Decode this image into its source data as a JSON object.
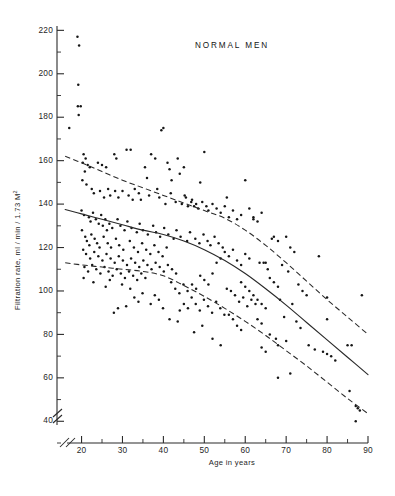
{
  "chart_data": {
    "type": "scatter",
    "title": "NORMAL MEN",
    "xlabel": "Age in years",
    "ylabel": "Filtration rate, ml / min / 1.73 M",
    "ylabel_superscript": "2",
    "xlim": [
      14,
      90
    ],
    "ylim": [
      30,
      222
    ],
    "xticks": [
      20,
      30,
      40,
      50,
      60,
      70,
      80,
      90
    ],
    "xtick_labels": [
      "20",
      "30",
      "40",
      "50",
      "60",
      "70",
      "80",
      "90"
    ],
    "x_minor_step": 5,
    "yticks": [
      40,
      60,
      80,
      100,
      120,
      140,
      160,
      180,
      200,
      220
    ],
    "ytick_labels": [
      "40",
      "60",
      "80",
      "100",
      "120",
      "140",
      "160",
      "180",
      "200",
      "220"
    ],
    "y_minor_step": 10,
    "grid": false,
    "legend": null,
    "axis_break": true,
    "axis_break_note": "double-slash break near origin on both axes",
    "marker_color": "#161616",
    "curve_color": "#2a2a2a",
    "series": [
      {
        "name": "mean regression",
        "style": "solid",
        "x": [
          16,
          20,
          25,
          30,
          35,
          40,
          45,
          50,
          55,
          60,
          65,
          70,
          75,
          80,
          85,
          90
        ],
        "values": [
          137.5,
          135.5,
          133.0,
          130.5,
          128.0,
          126.0,
          123.0,
          119.0,
          114.0,
          108.0,
          101.0,
          93.5,
          85.5,
          77.5,
          69.5,
          61.5
        ]
      },
      {
        "name": "upper limit",
        "style": "dashed",
        "x": [
          16,
          20,
          25,
          30,
          35,
          40,
          45,
          50,
          55,
          60,
          65,
          70,
          75,
          80,
          85,
          90
        ],
        "values": [
          162.0,
          159.0,
          155.0,
          151.0,
          147.5,
          144.0,
          140.5,
          137.0,
          133.5,
          128.0,
          121.0,
          113.0,
          104.5,
          96.0,
          88.0,
          80.0
        ]
      },
      {
        "name": "lower limit",
        "style": "dashed",
        "x": [
          16,
          20,
          25,
          30,
          35,
          40,
          45,
          50,
          55,
          60,
          65,
          70,
          75,
          80,
          85,
          90
        ],
        "values": [
          113.0,
          112.0,
          111.0,
          110.0,
          109.0,
          107.0,
          102.5,
          97.5,
          92.0,
          86.0,
          79.5,
          72.5,
          65.5,
          58.0,
          50.5,
          43.5
        ]
      }
    ],
    "points": [
      [
        19,
        217
      ],
      [
        19.4,
        213
      ],
      [
        19.2,
        195
      ],
      [
        19.1,
        185
      ],
      [
        19.8,
        185
      ],
      [
        19.3,
        181
      ],
      [
        17,
        175
      ],
      [
        40,
        175
      ],
      [
        39.5,
        174
      ],
      [
        31,
        165
      ],
      [
        32,
        165
      ],
      [
        20.5,
        163
      ],
      [
        21,
        161
      ],
      [
        28,
        163
      ],
      [
        28.5,
        161
      ],
      [
        37,
        163
      ],
      [
        38,
        161
      ],
      [
        50,
        164
      ],
      [
        43.5,
        161
      ],
      [
        20.3,
        159
      ],
      [
        21.5,
        158
      ],
      [
        22,
        157
      ],
      [
        24,
        159
      ],
      [
        25,
        158
      ],
      [
        26,
        157
      ],
      [
        41,
        159
      ],
      [
        41.5,
        156
      ],
      [
        44,
        154
      ],
      [
        45,
        157
      ],
      [
        20.8,
        155
      ],
      [
        20.2,
        151
      ],
      [
        21.2,
        149
      ],
      [
        22.5,
        147
      ],
      [
        35.5,
        157
      ],
      [
        36,
        152
      ],
      [
        42,
        151
      ],
      [
        49,
        150
      ],
      [
        60,
        151
      ],
      [
        23,
        145
      ],
      [
        24.5,
        146
      ],
      [
        25.5,
        143
      ],
      [
        26.5,
        147
      ],
      [
        27,
        144
      ],
      [
        28.2,
        146
      ],
      [
        29,
        143
      ],
      [
        30,
        146
      ],
      [
        31.5,
        144
      ],
      [
        32.5,
        142
      ],
      [
        33,
        147
      ],
      [
        34,
        145
      ],
      [
        34.5,
        142
      ],
      [
        36.5,
        144
      ],
      [
        38.5,
        147
      ],
      [
        39,
        143
      ],
      [
        40.5,
        140
      ],
      [
        41.8,
        145
      ],
      [
        43,
        141
      ],
      [
        44.5,
        140
      ],
      [
        45.5,
        143
      ],
      [
        46,
        139
      ],
      [
        47,
        142
      ],
      [
        48,
        140
      ],
      [
        48.5,
        138
      ],
      [
        49.5,
        141
      ],
      [
        50.5,
        139
      ],
      [
        51,
        137
      ],
      [
        52,
        140
      ],
      [
        53,
        138
      ],
      [
        54,
        136
      ],
      [
        55,
        139
      ],
      [
        56,
        134
      ],
      [
        57,
        137
      ],
      [
        58,
        133
      ],
      [
        59,
        135
      ],
      [
        61,
        138
      ],
      [
        62,
        134
      ],
      [
        63,
        132
      ],
      [
        64,
        136
      ],
      [
        55.5,
        143
      ],
      [
        45.2,
        144
      ],
      [
        46.8,
        141
      ],
      [
        47.5,
        139
      ],
      [
        20,
        137
      ],
      [
        20.6,
        135
      ],
      [
        21.8,
        134
      ],
      [
        22.2,
        132
      ],
      [
        22.8,
        136
      ],
      [
        23.5,
        133
      ],
      [
        24.2,
        131
      ],
      [
        24.8,
        135
      ],
      [
        25.2,
        130
      ],
      [
        25.8,
        133
      ],
      [
        26.2,
        128
      ],
      [
        26.8,
        131
      ],
      [
        27.5,
        129
      ],
      [
        28.8,
        133
      ],
      [
        29.5,
        130
      ],
      [
        30.5,
        128
      ],
      [
        31.2,
        132
      ],
      [
        32.2,
        129
      ],
      [
        33.5,
        127
      ],
      [
        34.2,
        131
      ],
      [
        35,
        128
      ],
      [
        36.2,
        126
      ],
      [
        37.5,
        130
      ],
      [
        38.2,
        127
      ],
      [
        39.2,
        125
      ],
      [
        40.2,
        129
      ],
      [
        41.2,
        126
      ],
      [
        42.5,
        124
      ],
      [
        43.2,
        128
      ],
      [
        44.2,
        125
      ],
      [
        45.8,
        123
      ],
      [
        46.5,
        127
      ],
      [
        47.8,
        124
      ],
      [
        48.8,
        122
      ],
      [
        49.8,
        126
      ],
      [
        50.8,
        123
      ],
      [
        51.5,
        121
      ],
      [
        52.5,
        125
      ],
      [
        53.5,
        122
      ],
      [
        54.5,
        120
      ],
      [
        20.1,
        128
      ],
      [
        20.9,
        125
      ],
      [
        21.3,
        123
      ],
      [
        21.9,
        121
      ],
      [
        22.4,
        126
      ],
      [
        23.2,
        124
      ],
      [
        23.8,
        122
      ],
      [
        24.4,
        120
      ],
      [
        25.4,
        125
      ],
      [
        26.4,
        122
      ],
      [
        27.2,
        120
      ],
      [
        28.4,
        124
      ],
      [
        29.2,
        121
      ],
      [
        30.2,
        119
      ],
      [
        31.8,
        123
      ],
      [
        32.8,
        120
      ],
      [
        33.8,
        118
      ],
      [
        34.8,
        122
      ],
      [
        35.8,
        119
      ],
      [
        36.8,
        117
      ],
      [
        37.8,
        121
      ],
      [
        38.8,
        118
      ],
      [
        39.8,
        116
      ],
      [
        40.8,
        120
      ],
      [
        20.4,
        119
      ],
      [
        21.1,
        117
      ],
      [
        22.1,
        115
      ],
      [
        23.1,
        118
      ],
      [
        24.1,
        116
      ],
      [
        25.1,
        114
      ],
      [
        26.1,
        117
      ],
      [
        27.1,
        115
      ],
      [
        28.1,
        113
      ],
      [
        29.1,
        116
      ],
      [
        30.1,
        114
      ],
      [
        31.1,
        112
      ],
      [
        32.1,
        115
      ],
      [
        33.1,
        113
      ],
      [
        34.1,
        111
      ],
      [
        35.1,
        114
      ],
      [
        36.1,
        112
      ],
      [
        37.1,
        110
      ],
      [
        38.1,
        113
      ],
      [
        39.1,
        111
      ],
      [
        40.1,
        109
      ],
      [
        41.1,
        112
      ],
      [
        42.1,
        110
      ],
      [
        43.1,
        108
      ],
      [
        20.7,
        111
      ],
      [
        21.6,
        109
      ],
      [
        22.6,
        112
      ],
      [
        23.6,
        110
      ],
      [
        24.6,
        108
      ],
      [
        25.6,
        111
      ],
      [
        26.6,
        109
      ],
      [
        27.6,
        107
      ],
      [
        28.6,
        110
      ],
      [
        29.6,
        108
      ],
      [
        30.6,
        106
      ],
      [
        31.6,
        109
      ],
      [
        32.6,
        107
      ],
      [
        33.6,
        105
      ],
      [
        34.6,
        108
      ],
      [
        35.6,
        106
      ],
      [
        22.9,
        104
      ],
      [
        25.9,
        102
      ],
      [
        20.5,
        106
      ],
      [
        26.9,
        105
      ],
      [
        29.9,
        103
      ],
      [
        31.9,
        101
      ],
      [
        28.9,
        92
      ],
      [
        30.9,
        93
      ],
      [
        32.9,
        97
      ],
      [
        33.9,
        95
      ],
      [
        27.9,
        90
      ],
      [
        34.9,
        99
      ],
      [
        36.9,
        94
      ],
      [
        37.9,
        98
      ],
      [
        38.9,
        96
      ],
      [
        39.9,
        92
      ],
      [
        41.9,
        104
      ],
      [
        42.9,
        101
      ],
      [
        43.9,
        99
      ],
      [
        44.9,
        103
      ],
      [
        45.9,
        100
      ],
      [
        46.9,
        97
      ],
      [
        47.9,
        94
      ],
      [
        48.9,
        91
      ],
      [
        49.9,
        96
      ],
      [
        50.9,
        93
      ],
      [
        51.9,
        90
      ],
      [
        52.9,
        95
      ],
      [
        53.9,
        92
      ],
      [
        54.9,
        89
      ],
      [
        43.5,
        86
      ],
      [
        41.5,
        87
      ],
      [
        55.5,
        101
      ],
      [
        56.5,
        100
      ],
      [
        57.5,
        98
      ],
      [
        58.5,
        95
      ],
      [
        59.5,
        97
      ],
      [
        60.5,
        93
      ],
      [
        61.5,
        96
      ],
      [
        62.5,
        94
      ],
      [
        63.5,
        113
      ],
      [
        64.5,
        113
      ],
      [
        65,
        113
      ],
      [
        65.5,
        110
      ],
      [
        62,
        133
      ],
      [
        66,
        106
      ],
      [
        67,
        104
      ],
      [
        68,
        102
      ],
      [
        55,
        118
      ],
      [
        56,
        116
      ],
      [
        57,
        119
      ],
      [
        58,
        114
      ],
      [
        59,
        112
      ],
      [
        60,
        117
      ],
      [
        61,
        115
      ],
      [
        53,
        113
      ],
      [
        54,
        115
      ],
      [
        49,
        107
      ],
      [
        50,
        105
      ],
      [
        51,
        103
      ],
      [
        52,
        108
      ],
      [
        48,
        101
      ],
      [
        47,
        103
      ],
      [
        46,
        92
      ],
      [
        45,
        94
      ],
      [
        44,
        91
      ],
      [
        49.5,
        84
      ],
      [
        47.5,
        81
      ],
      [
        52,
        78
      ],
      [
        54,
        75
      ],
      [
        56,
        89
      ],
      [
        57,
        87
      ],
      [
        58,
        84
      ],
      [
        59,
        82
      ],
      [
        66.5,
        124
      ],
      [
        67,
        125
      ],
      [
        70,
        125
      ],
      [
        68,
        123
      ],
      [
        71,
        120
      ],
      [
        72,
        118
      ],
      [
        69,
        112
      ],
      [
        70.5,
        109
      ],
      [
        73,
        103
      ],
      [
        74,
        100
      ],
      [
        75,
        98
      ],
      [
        68.5,
        96
      ],
      [
        71.5,
        94
      ],
      [
        69.5,
        88
      ],
      [
        72.5,
        86
      ],
      [
        73.5,
        83
      ],
      [
        66,
        80
      ],
      [
        67.5,
        78
      ],
      [
        70,
        77
      ],
      [
        68,
        75
      ],
      [
        75.5,
        75
      ],
      [
        77,
        73
      ],
      [
        79,
        72
      ],
      [
        80,
        71
      ],
      [
        65,
        72
      ],
      [
        64,
        74
      ],
      [
        68,
        60
      ],
      [
        71,
        62
      ],
      [
        80,
        97
      ],
      [
        78,
        116
      ],
      [
        80,
        87
      ],
      [
        81,
        70
      ],
      [
        82,
        68
      ],
      [
        85,
        75
      ],
      [
        86,
        75
      ],
      [
        85.5,
        54
      ],
      [
        87,
        47
      ],
      [
        87.5,
        46
      ],
      [
        88,
        45
      ],
      [
        87,
        40
      ],
      [
        88.5,
        98
      ],
      [
        59,
        104
      ],
      [
        60,
        102
      ],
      [
        61,
        100
      ],
      [
        62,
        98
      ],
      [
        63,
        96
      ],
      [
        64,
        94
      ],
      [
        65,
        92
      ],
      [
        63,
        87
      ],
      [
        64,
        85
      ]
    ]
  }
}
